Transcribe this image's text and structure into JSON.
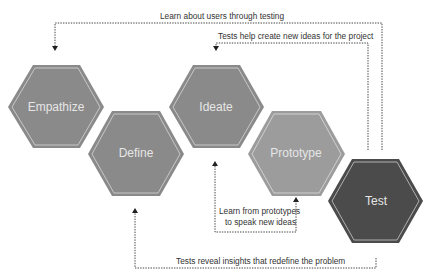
{
  "diagram": {
    "type": "design-thinking-process",
    "stages": [
      {
        "id": "empathize",
        "label": "Empathize",
        "fill": "#8a8a8a"
      },
      {
        "id": "define",
        "label": "Define",
        "fill": "#8a8a8a"
      },
      {
        "id": "ideate",
        "label": "Ideate",
        "fill": "#8a8a8a"
      },
      {
        "id": "prototype",
        "label": "Prototype",
        "fill": "#9c9c9c"
      },
      {
        "id": "test",
        "label": "Test",
        "fill": "#4b4b4b"
      }
    ],
    "feedback_loops": [
      {
        "id": "test-to-empathize",
        "label": "Learn about users through testing"
      },
      {
        "id": "test-to-ideate",
        "label": "Tests help create new ideas for the project"
      },
      {
        "id": "prototype-to-ideate",
        "label_line1": "Learn from prototypes",
        "label_line2": "to speak new ideas"
      },
      {
        "id": "test-to-define",
        "label": "Tests reveal insights that redefine the problem"
      }
    ],
    "colors": {
      "hex_inner_stroke": "#c8c8c8",
      "line": "#444444",
      "text": "#333333"
    }
  }
}
